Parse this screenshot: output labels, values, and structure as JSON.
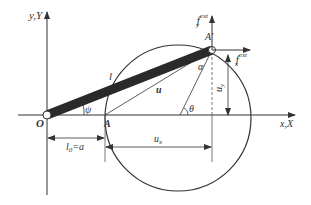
{
  "diagram": {
    "labels": {
      "y_axis": "y,Y",
      "x_axis": "x,X",
      "origin": "O",
      "point_A": "A",
      "point_A_prime": "A'",
      "bar_length": "l",
      "displacement": "u",
      "angle_psi": "ψ",
      "angle_theta": "θ",
      "angle_alpha": "α",
      "ux": "u",
      "ux_sub": "x",
      "uy": "u",
      "uy_sub": "y",
      "l0_main": "l",
      "l0_sub": "0",
      "l0_eq": "=a",
      "fx_main": "f",
      "fx_sub": "x",
      "fx_sup": "ext",
      "fy_main": "f",
      "fy_sub": "y",
      "fy_sup": "ext"
    },
    "colors": {
      "line": "#333333",
      "bar": "#2a2a2a",
      "background": "#ffffff"
    }
  }
}
